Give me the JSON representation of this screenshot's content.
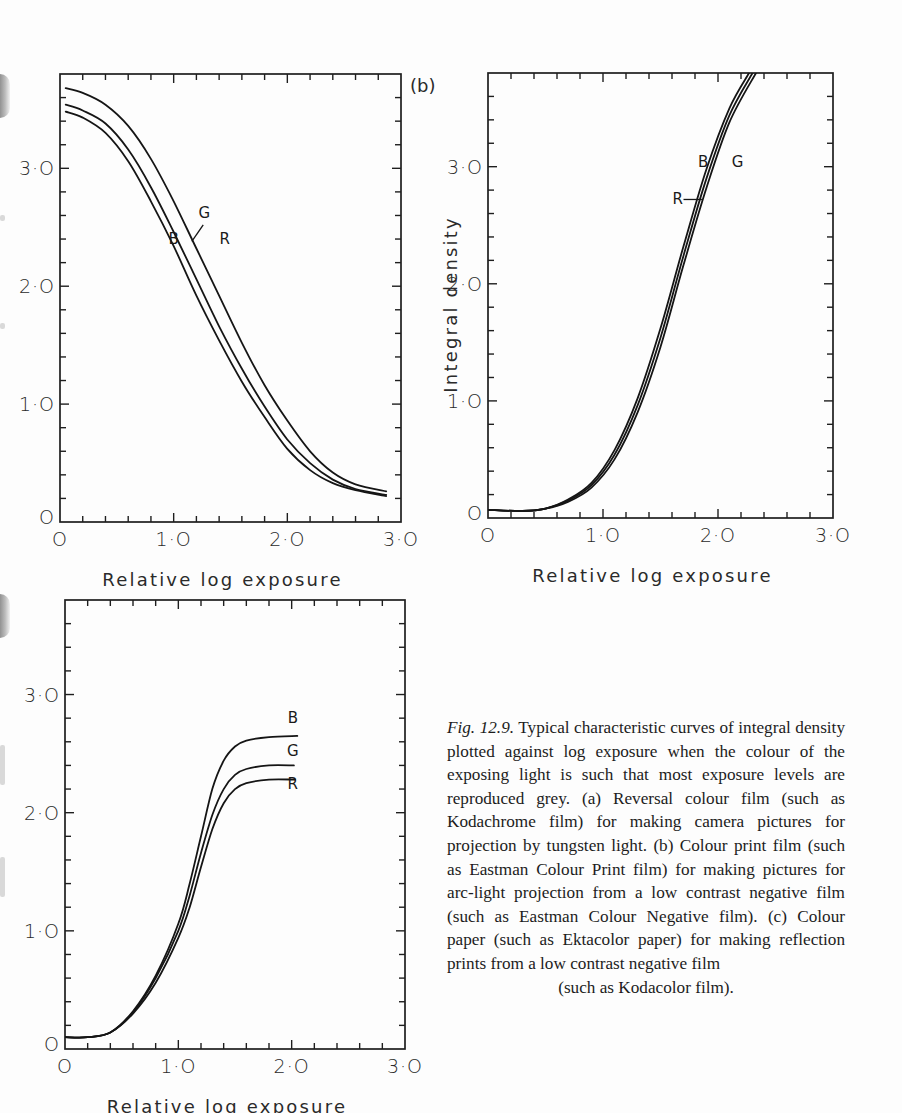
{
  "figure": {
    "panel_tag_b": "(b)",
    "caption": {
      "figure_number": "Fig. 12.9.",
      "body": "Typical characteristic curves of integral density plotted against log exposure when the colour of the exposing light is such that most exposure levels are reproduced grey. (a) Reversal colour film (such as Kodachrome film) for making camera pictures for projection by tungsten light. (b) Colour print film (such as Eastman Colour Print film) for making pictures for arc-light projection from a low contrast negative film (such as Eastman Colour Negative film). (c) Colour paper (such as Ektacolor paper) for making reflection prints from a low contrast negative film",
      "last_line": "(such as Kodacolor film)."
    }
  },
  "chart_data": [
    {
      "id": "a",
      "type": "line",
      "title": "",
      "xlabel": "Relative log exposure",
      "ylabel": "",
      "xlim": [
        0,
        3.0
      ],
      "ylim": [
        0,
        3.8
      ],
      "xticks": [
        "O",
        "1·O",
        "2·O",
        "3·O"
      ],
      "yticks": [
        "O",
        "1·O",
        "2·O",
        "3·O"
      ],
      "grid": false,
      "frame_px": {
        "left": 60,
        "top": 74,
        "right": 401,
        "bottom": 522
      },
      "series": [
        {
          "name": "R",
          "x": [
            0.05,
            0.2,
            0.4,
            0.6,
            0.8,
            1.0,
            1.2,
            1.4,
            1.6,
            1.8,
            2.0,
            2.2,
            2.4,
            2.6,
            2.87
          ],
          "y": [
            3.68,
            3.64,
            3.54,
            3.36,
            3.08,
            2.72,
            2.32,
            1.92,
            1.52,
            1.16,
            0.86,
            0.6,
            0.42,
            0.32,
            0.26
          ]
        },
        {
          "name": "G",
          "x": [
            0.05,
            0.2,
            0.4,
            0.6,
            0.8,
            1.0,
            1.2,
            1.4,
            1.6,
            1.8,
            2.0,
            2.2,
            2.4,
            2.6,
            2.87
          ],
          "y": [
            3.54,
            3.49,
            3.38,
            3.16,
            2.84,
            2.46,
            2.06,
            1.66,
            1.3,
            0.98,
            0.7,
            0.5,
            0.36,
            0.28,
            0.23
          ]
        },
        {
          "name": "B",
          "x": [
            0.05,
            0.2,
            0.4,
            0.6,
            0.8,
            1.0,
            1.2,
            1.4,
            1.6,
            1.8,
            2.0,
            2.2,
            2.4,
            2.6,
            2.87
          ],
          "y": [
            3.48,
            3.43,
            3.3,
            3.06,
            2.72,
            2.34,
            1.92,
            1.54,
            1.19,
            0.89,
            0.62,
            0.44,
            0.33,
            0.27,
            0.22
          ]
        }
      ],
      "annotations": [
        {
          "text": "G",
          "x": 1.27,
          "y": 2.58
        },
        {
          "text": "B",
          "x": 1.0,
          "y": 2.36
        },
        {
          "text": "R",
          "x": 1.45,
          "y": 2.36
        }
      ]
    },
    {
      "id": "b",
      "type": "line",
      "title": "",
      "xlabel": "Relative log exposure",
      "ylabel": "Integral density",
      "xlim": [
        0,
        3.0
      ],
      "ylim": [
        0,
        3.8
      ],
      "xticks": [
        "O",
        "1·O",
        "2·O",
        "3·O"
      ],
      "yticks": [
        "O",
        "1·O",
        "2·O",
        "3·O"
      ],
      "grid": false,
      "frame_px": {
        "left": 488,
        "top": 73,
        "right": 833,
        "bottom": 518
      },
      "series": [
        {
          "name": "B",
          "x": [
            0,
            0.3,
            0.5,
            0.7,
            0.9,
            1.1,
            1.3,
            1.5,
            1.7,
            1.9,
            2.1,
            2.27
          ],
          "y": [
            0.07,
            0.06,
            0.08,
            0.16,
            0.3,
            0.58,
            1.02,
            1.62,
            2.32,
            2.98,
            3.5,
            3.8
          ]
        },
        {
          "name": "R",
          "x": [
            0,
            0.3,
            0.5,
            0.7,
            0.9,
            1.1,
            1.3,
            1.5,
            1.7,
            1.9,
            2.1,
            2.3
          ],
          "y": [
            0.07,
            0.06,
            0.08,
            0.15,
            0.28,
            0.54,
            0.96,
            1.54,
            2.24,
            2.9,
            3.44,
            3.8
          ]
        },
        {
          "name": "G",
          "x": [
            0,
            0.3,
            0.5,
            0.7,
            0.9,
            1.1,
            1.3,
            1.5,
            1.7,
            1.9,
            2.1,
            2.33
          ],
          "y": [
            0.07,
            0.06,
            0.08,
            0.14,
            0.26,
            0.5,
            0.9,
            1.46,
            2.16,
            2.82,
            3.38,
            3.8
          ]
        }
      ],
      "annotations": [
        {
          "text": "B",
          "x": 1.87,
          "y": 3.0
        },
        {
          "text": "G",
          "x": 2.17,
          "y": 3.0
        },
        {
          "text": "R",
          "x": 1.65,
          "y": 2.68
        }
      ]
    },
    {
      "id": "c",
      "type": "line",
      "title": "",
      "xlabel": "Relative log exposure",
      "ylabel": "",
      "xlim": [
        0,
        3.0
      ],
      "ylim": [
        0,
        3.8
      ],
      "xticks": [
        "O",
        "1·O",
        "2·O",
        "3·O"
      ],
      "yticks": [
        "O",
        "1·O",
        "2·O",
        "3·O"
      ],
      "grid": false,
      "frame_px": {
        "left": 65,
        "top": 600,
        "right": 405,
        "bottom": 1049
      },
      "series": [
        {
          "name": "B",
          "x": [
            0,
            0.2,
            0.4,
            0.6,
            0.8,
            1.0,
            1.1,
            1.2,
            1.3,
            1.4,
            1.5,
            1.6,
            1.8,
            2.05
          ],
          "y": [
            0.1,
            0.1,
            0.14,
            0.32,
            0.62,
            1.06,
            1.4,
            1.8,
            2.2,
            2.44,
            2.56,
            2.61,
            2.64,
            2.65
          ]
        },
        {
          "name": "G",
          "x": [
            0,
            0.2,
            0.4,
            0.6,
            0.8,
            1.0,
            1.1,
            1.2,
            1.3,
            1.4,
            1.5,
            1.6,
            1.8,
            2.02
          ],
          "y": [
            0.1,
            0.1,
            0.14,
            0.31,
            0.6,
            1.0,
            1.3,
            1.66,
            1.98,
            2.2,
            2.32,
            2.37,
            2.4,
            2.4
          ]
        },
        {
          "name": "R",
          "x": [
            0,
            0.2,
            0.4,
            0.6,
            0.8,
            1.0,
            1.1,
            1.2,
            1.3,
            1.4,
            1.5,
            1.6,
            1.8,
            2.03
          ],
          "y": [
            0.1,
            0.1,
            0.14,
            0.3,
            0.56,
            0.94,
            1.2,
            1.54,
            1.86,
            2.08,
            2.2,
            2.25,
            2.28,
            2.28
          ]
        }
      ],
      "annotations": [
        {
          "text": "B",
          "x": 2.01,
          "y": 2.76
        },
        {
          "text": "G",
          "x": 2.01,
          "y": 2.48
        },
        {
          "text": "R",
          "x": 2.01,
          "y": 2.2
        }
      ]
    }
  ]
}
